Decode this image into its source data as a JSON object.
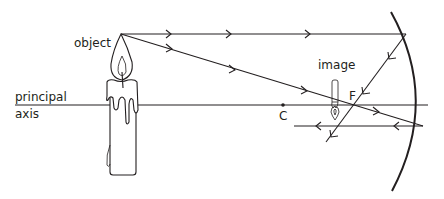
{
  "diagram": {
    "type": "concave-mirror-ray-diagram",
    "labels": {
      "object": "object",
      "image": "image",
      "principal_line1": "principal",
      "principal_line2": "axis",
      "center_of_curvature": "C",
      "focus": "F"
    },
    "colors": {
      "ink": "#231f20",
      "background": "#ffffff"
    },
    "elements": [
      {
        "name": "principal-axis",
        "description": "horizontal line through C and F to mirror pole"
      },
      {
        "name": "object-candle",
        "description": "upright lit candle left of C"
      },
      {
        "name": "concave-mirror",
        "description": "curved mirror on the right"
      },
      {
        "name": "ray-parallel",
        "description": "ray parallel to axis, reflects through F"
      },
      {
        "name": "ray-through-focus",
        "description": "ray through F, reflects parallel to axis"
      },
      {
        "name": "image-candle",
        "description": "small inverted real image between C and F"
      }
    ]
  }
}
